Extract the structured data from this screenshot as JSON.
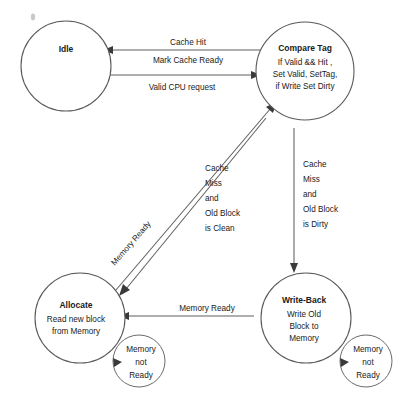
{
  "diagram": {
    "type": "finite-state-machine",
    "states": [
      {
        "id": "idle",
        "title": "Idle",
        "body": []
      },
      {
        "id": "compare-tag",
        "title": "Compare Tag",
        "body": [
          "If Valid && Hit ,",
          "Set Valid, SetTag,",
          "if Write Set Dirty"
        ]
      },
      {
        "id": "allocate",
        "title": "Allocate",
        "body": [
          "Read new block",
          "from Memory"
        ]
      },
      {
        "id": "write-back",
        "title": "Write-Back",
        "body": [
          "Write Old",
          "Block to",
          "Memory"
        ]
      }
    ],
    "transitions": [
      {
        "id": "compare-tag-to-idle",
        "from": "compare-tag",
        "to": "idle",
        "label_lines": [
          "Cache Hit",
          "Mark Cache Ready"
        ]
      },
      {
        "id": "idle-to-compare-tag",
        "from": "idle",
        "to": "compare-tag",
        "label_lines": [
          "Valid CPU request"
        ]
      },
      {
        "id": "compare-tag-to-allocate",
        "from": "compare-tag",
        "to": "allocate",
        "label_lines": [
          "Cache",
          "Miss",
          "and",
          "Old Block",
          "is Clean"
        ]
      },
      {
        "id": "compare-tag-to-write-back",
        "from": "compare-tag",
        "to": "write-back",
        "label_lines": [
          "Cache",
          "Miss",
          "and",
          "Old Block",
          "is Dirty"
        ]
      },
      {
        "id": "allocate-to-compare-tag",
        "from": "allocate",
        "to": "compare-tag",
        "label_lines": [
          "Memory Ready"
        ]
      },
      {
        "id": "write-back-to-allocate",
        "from": "write-back",
        "to": "allocate",
        "label_lines": [
          "Memory Ready"
        ]
      },
      {
        "id": "allocate-self-loop",
        "from": "allocate",
        "to": "allocate",
        "label_lines": [
          "Memory",
          "not",
          "Ready"
        ]
      },
      {
        "id": "write-back-self-loop",
        "from": "write-back",
        "to": "write-back",
        "label_lines": [
          "Memory",
          "not",
          "Ready"
        ]
      }
    ],
    "colors": {
      "background": "#ffffff",
      "state_fill": "#ffffff",
      "state_stroke": "#5a5a5a",
      "shadow": "#4a4a4a",
      "edge": "#5f5f5f",
      "text": "#1a1a1a"
    }
  }
}
